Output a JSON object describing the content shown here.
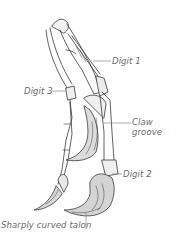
{
  "figure": {
    "labels": {
      "digit1": "Digit 1",
      "digit3": "Digit 3",
      "claw_groove_line1": "Claw",
      "claw_groove_line2": "groove",
      "digit2": "Digit 2",
      "talon": "Sharply curved talon"
    },
    "colors": {
      "ink": "#3a3a3a",
      "label_text": "#6a6a6a",
      "leader_line": "#8a8a8a",
      "background": "#ffffff"
    }
  }
}
